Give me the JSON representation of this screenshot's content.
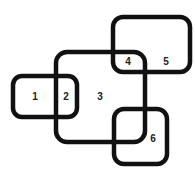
{
  "diagram": {
    "type": "overlapping-rounded-rectangles",
    "stroke_color": "#111111",
    "background": "#ffffff",
    "regions": [
      {
        "id": "1",
        "label": "1"
      },
      {
        "id": "2",
        "label": "2"
      },
      {
        "id": "3",
        "label": "3"
      },
      {
        "id": "4",
        "label": "4"
      },
      {
        "id": "5",
        "label": "5"
      },
      {
        "id": "6",
        "label": "6"
      }
    ]
  }
}
